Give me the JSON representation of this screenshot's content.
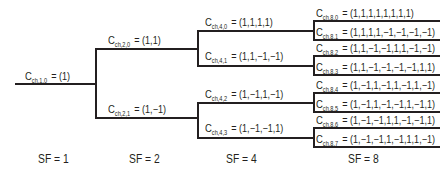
{
  "diagram": {
    "root": {
      "name": "C",
      "sub": "ch,1,0",
      "value": "= (1)"
    },
    "level2": [
      {
        "name": "C",
        "sub": "ch,2,0",
        "value": "= (1,1)"
      },
      {
        "name": "C",
        "sub": "ch,2,1",
        "value": "= (1,−1)"
      }
    ],
    "level4": [
      {
        "name": "C",
        "sub": "ch,4,0",
        "value": "= (1,1,1,1)"
      },
      {
        "name": "C",
        "sub": "ch,4,1",
        "value": "= (1,1,−1,−1)"
      },
      {
        "name": "C",
        "sub": "ch,4,2",
        "value": "= (1,−1,1,−1)"
      },
      {
        "name": "C",
        "sub": "ch,4,3",
        "value": "= (1,−1,−1,1)"
      }
    ],
    "level8": [
      {
        "name": "C",
        "sub": "ch,8,0",
        "value": "= (1,1,1,1,1,1,1,1)"
      },
      {
        "name": "C",
        "sub": "ch,8,1",
        "value": "= (1,1,1,1,−1,−1,−1,−1)"
      },
      {
        "name": "C",
        "sub": "ch,8,2",
        "value": "= (1,1,−1,−1,1,1,−1,−1)"
      },
      {
        "name": "C",
        "sub": "ch,8,3",
        "value": "= (1,1,−1,−1,−1,−1,1,1)"
      },
      {
        "name": "C",
        "sub": "ch,8,4",
        "value": "= (1,−1,1,−1,1,−1,1,−1)"
      },
      {
        "name": "C",
        "sub": "ch,8,5",
        "value": "= (1,−1,1,−1,−1,1,−1,1)"
      },
      {
        "name": "C",
        "sub": "ch,8,6",
        "value": "= (1,−1,−1,1,1,−1,−1,1)"
      },
      {
        "name": "C",
        "sub": "ch,8,7",
        "value": "= (1,−1,−1,1,−1,1,1,−1)"
      }
    ],
    "sf_labels": [
      "SF = 1",
      "SF = 2",
      "SF = 4",
      "SF = 8"
    ],
    "line_color": "#231f20"
  }
}
